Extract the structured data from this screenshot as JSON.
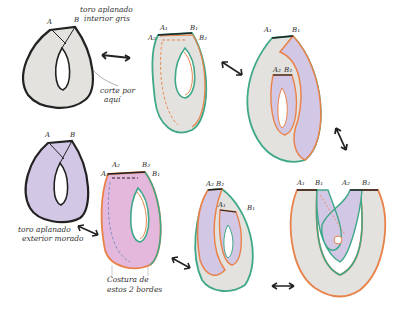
{
  "figures": [
    {
      "id": "fig1",
      "labels": [
        "A",
        "B"
      ],
      "note_lines": [
        "toro aplanado",
        "interior gris"
      ],
      "cut_note_lines": [
        "corte por",
        "aquí"
      ]
    },
    {
      "id": "fig2",
      "labels": [
        "A₁",
        "B₁",
        "A₂",
        "B₂"
      ]
    },
    {
      "id": "fig3",
      "labels": [
        "A₁",
        "B₁",
        "A₂",
        "B₂"
      ]
    },
    {
      "id": "fig4",
      "labels": [
        "A",
        "B"
      ],
      "note_lines": [
        "toro aplanado",
        "exterior morado"
      ]
    },
    {
      "id": "fig5",
      "labels": [
        "A₂",
        "B₂",
        "A₁",
        "B₁"
      ],
      "note_lines": [
        "Costura de",
        "estos 2 bordes"
      ]
    },
    {
      "id": "fig6",
      "labels": [
        "A₂",
        "B₂",
        "A₁",
        "B₁"
      ]
    },
    {
      "id": "fig7",
      "labels": [
        "A₁",
        "B₁",
        "A₂",
        "B₂"
      ]
    }
  ],
  "colors": {
    "gray_fill": "#e4e2de",
    "purple_fill": "#d3c7e6",
    "pink_fill": "#e3b8dc",
    "teal_edge": "#3fa889",
    "orange_edge": "#e8824a",
    "black_edge": "#222222"
  }
}
